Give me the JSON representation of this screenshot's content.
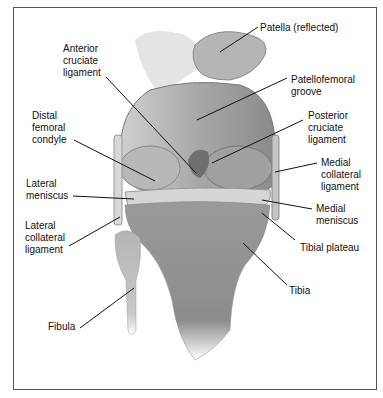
{
  "figure": {
    "labels": {
      "patella": "Patella (reflected)",
      "acl": "Anterior\ncruciate\nligament",
      "patellofemoral_groove": "Patellofemoral\ngroove",
      "distal_femoral_condyle": "Distal\nfemoral\ncondyle",
      "pcl": "Posterior\ncruciate\nligament",
      "mcl": "Medial\ncollateral\nligament",
      "lateral_meniscus": "Lateral\nmeniscus",
      "medial_meniscus": "Medial\nmeniscus",
      "lcl": "Lateral\ncollateral\nligament",
      "tibial_plateau": "Tibial plateau",
      "tibia": "Tibia",
      "fibula": "Fibula"
    }
  }
}
